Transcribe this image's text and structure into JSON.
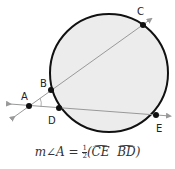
{
  "diagram": {
    "type": "circle with two secants from external point",
    "circle": {
      "cx": 109,
      "cy": 73,
      "r": 59,
      "fill": "#ececec",
      "stroke": "#111111"
    },
    "points": [
      {
        "label": "A",
        "x": 29,
        "y": 106,
        "label_x": 20,
        "label_y": 100
      },
      {
        "label": "B",
        "x": 51,
        "y": 90,
        "label_x": 40,
        "label_y": 86
      },
      {
        "label": "C",
        "x": 143,
        "y": 25,
        "label_x": 137,
        "label_y": 15
      },
      {
        "label": "D",
        "x": 59,
        "y": 108,
        "label_x": 48,
        "label_y": 123
      },
      {
        "label": "E",
        "x": 156,
        "y": 115,
        "label_x": 156,
        "label_y": 131
      }
    ],
    "line_color": "#999999"
  },
  "formula": {
    "lhs": "m∠A = ",
    "frac_num": "1",
    "frac_den": "2",
    "open": "(",
    "arc1": "CE",
    "arc2": "BD",
    "close": ")"
  }
}
